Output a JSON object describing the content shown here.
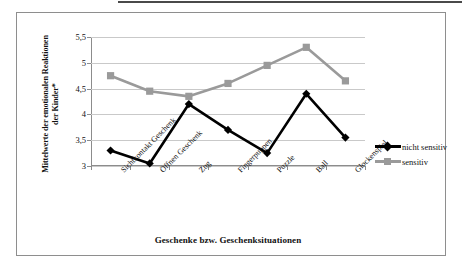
{
  "chart_data": {
    "type": "line",
    "title": "",
    "xlabel": "Geschenke bzw. Geschenksituationen",
    "ylabel": "Mittelwerte der emotionalen Reaktionen der Kinder*",
    "categories": [
      "Sichtkontakt Geschenk",
      "Öffnen Geschenk",
      "Zug",
      "Fingerpuppen",
      "Puzzle",
      "Ball",
      "Glockenspiel"
    ],
    "series": [
      {
        "name": "nicht sensitiv",
        "color": "#000000",
        "marker": "diamond",
        "values": [
          3.3,
          3.05,
          4.2,
          3.7,
          3.25,
          4.4,
          3.55
        ]
      },
      {
        "name": "sensitiv",
        "color": "#9a9a9a",
        "marker": "square",
        "values": [
          4.75,
          4.45,
          4.35,
          4.6,
          4.95,
          5.3,
          4.65
        ]
      }
    ],
    "ylim": [
      3,
      5.5
    ],
    "ytick_labels": [
      "3",
      "3,5",
      "4",
      "4,5",
      "5",
      "5,5"
    ],
    "ytick_values": [
      3,
      3.5,
      4,
      4.5,
      5,
      5.5
    ],
    "grid": true,
    "legend_position": "right"
  },
  "legend": {
    "items": [
      {
        "label": "nicht sensitiv"
      },
      {
        "label": "sensitiv"
      }
    ]
  }
}
